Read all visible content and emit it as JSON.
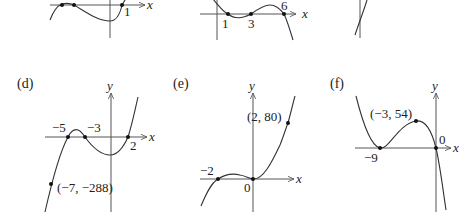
{
  "figure": {
    "panels": [
      {
        "id": "a",
        "label": "",
        "x_axis_label": "x",
        "y_axis_label": "",
        "tick_labels": [
          "1"
        ],
        "points": []
      },
      {
        "id": "b",
        "label": "",
        "x_axis_label": "x",
        "y_axis_label": "",
        "tick_labels": [
          "1",
          "3",
          "6"
        ],
        "points": []
      },
      {
        "id": "c",
        "label": "",
        "x_axis_label": "",
        "y_axis_label": "",
        "tick_labels": [],
        "points": []
      },
      {
        "id": "d",
        "label": "(d)",
        "x_axis_label": "x",
        "y_axis_label": "y",
        "tick_labels": [
          "−5",
          "−3",
          "2"
        ],
        "points": [
          "(−7, −288)"
        ]
      },
      {
        "id": "e",
        "label": "(e)",
        "x_axis_label": "x",
        "y_axis_label": "y",
        "tick_labels": [
          "−2",
          "0"
        ],
        "points": [
          "(2, 80)"
        ]
      },
      {
        "id": "f",
        "label": "(f)",
        "x_axis_label": "x",
        "y_axis_label": "y",
        "tick_labels": [
          "−9",
          "0"
        ],
        "points": [
          "(−3, 54)"
        ]
      }
    ]
  },
  "colors": {
    "curve": "#333333",
    "axis": "#555555",
    "background": "#ffffff"
  }
}
